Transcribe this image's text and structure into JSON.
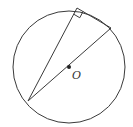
{
  "diagram": {
    "type": "geometry",
    "colors": {
      "stroke": "#3a3a3a",
      "background": "#ffffff"
    },
    "circle": {
      "cx": 69,
      "cy": 67,
      "r": 56
    },
    "center": {
      "x": 69,
      "y": 67,
      "label": "O"
    },
    "points": {
      "A": {
        "x": 28,
        "y": 101
      },
      "B": {
        "x": 111,
        "y": 28
      },
      "C": {
        "x": 77,
        "y": 8
      }
    },
    "segments": [
      {
        "from": "A",
        "to": "B",
        "role": "diameter"
      },
      {
        "from": "A",
        "to": "C",
        "role": "chord"
      },
      {
        "from": "C",
        "to": "B",
        "role": "chord"
      }
    ],
    "right_angle_at": "C",
    "labels": {
      "center_label": "O"
    }
  }
}
